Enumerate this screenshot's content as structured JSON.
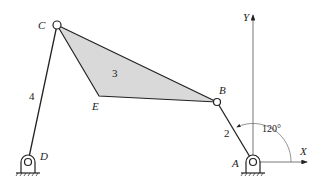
{
  "points": {
    "A": "A",
    "B": "B",
    "C": "C",
    "D": "D",
    "E": "E"
  },
  "links": {
    "link2": "2",
    "link3": "3",
    "link4": "4"
  },
  "axes": {
    "x": "X",
    "y": "Y"
  },
  "angle": "120°",
  "colors": {
    "line": "#222222",
    "fill": "#d9d9d9",
    "axis": "#555555"
  }
}
